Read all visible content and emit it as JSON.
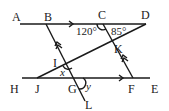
{
  "diagram": {
    "points": {
      "A": {
        "label": "A",
        "x": 8,
        "y": 21
      },
      "B": {
        "label": "B",
        "x": 44,
        "y": 21
      },
      "C": {
        "label": "C",
        "x": 98,
        "y": 19
      },
      "D": {
        "label": "D",
        "x": 142,
        "y": 19
      },
      "K": {
        "label": "K",
        "x": 114,
        "y": 52
      },
      "I": {
        "label": "I",
        "x": 52,
        "y": 65
      },
      "H": {
        "label": "H",
        "x": 7,
        "y": 93
      },
      "J": {
        "label": "J",
        "x": 33,
        "y": 93
      },
      "G": {
        "label": "G",
        "x": 68,
        "y": 93
      },
      "F": {
        "label": "F",
        "x": 128,
        "y": 93
      },
      "E": {
        "label": "E",
        "x": 152,
        "y": 93
      },
      "L": {
        "label": "L",
        "x": 85,
        "y": 108
      }
    },
    "angles": {
      "angle_BCK": "120°",
      "angle_KDC": "85°",
      "x": "x",
      "y": "y"
    },
    "segments": [
      {
        "name": "AD",
        "from": [
          20,
          24
        ],
        "to": [
          146,
          24
        ]
      },
      {
        "name": "HE",
        "from": [
          22,
          78
        ],
        "to": [
          150,
          78
        ]
      },
      {
        "name": "BL",
        "from": [
          46,
          24
        ],
        "to": [
          85,
          101
        ]
      },
      {
        "name": "CF",
        "from": [
          103,
          24
        ],
        "to": [
          133,
          78
        ]
      },
      {
        "name": "DJ",
        "from": [
          146,
          24
        ],
        "to": [
          37,
          78
        ]
      }
    ],
    "colors": {
      "ink": "#1a1a1a",
      "background": "#ffffff"
    }
  }
}
